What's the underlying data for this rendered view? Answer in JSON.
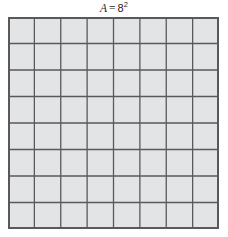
{
  "figure": {
    "title": {
      "variable": "A",
      "equals": "=",
      "base": "8",
      "exponent": "2",
      "full_text": "A = 8²"
    },
    "background_color": "#ffffff"
  },
  "grid": {
    "columns": 8,
    "rows": 8,
    "total_cells": 64,
    "cell_fill_color": "#e3e4e5",
    "gridline_color": "#58595b",
    "border_color": "#58595b",
    "gridline_width": 1.3,
    "border_width": 2,
    "cell_width_px": 26.375,
    "cell_height_px": 26.5,
    "origin_x_px": 8,
    "origin_y_px": 17,
    "total_width_px": 211,
    "total_height_px": 212
  },
  "chart_data": {
    "type": "table",
    "side_length": 8,
    "area": 64,
    "columns": 8,
    "rows": 8,
    "unit_squares": 64,
    "xlabel": "",
    "ylabel": "",
    "legend": []
  }
}
